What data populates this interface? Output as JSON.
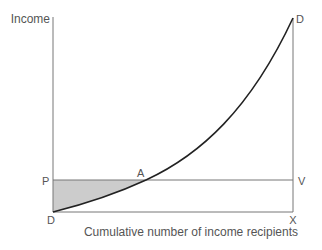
{
  "diagram": {
    "y_axis_label": "Income",
    "x_axis_label": "Cumulative number of income recipients",
    "points": {
      "top_right": "D",
      "origin": "D",
      "poverty_left": "P",
      "intersection": "A",
      "poverty_right": "V",
      "bottom_right": "X"
    },
    "colors": {
      "axis": "#777777",
      "curve": "#222222",
      "shade": "#cccccc",
      "text": "#555555"
    }
  }
}
